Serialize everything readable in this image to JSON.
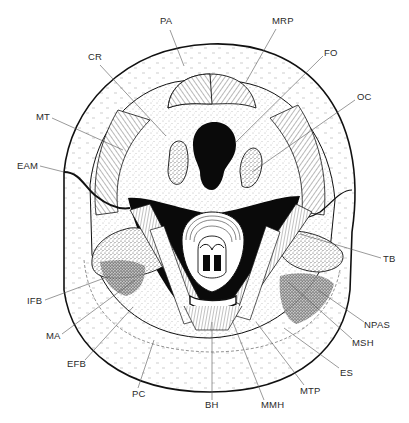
{
  "figure": {
    "type": "anatomical-diagram",
    "colors": {
      "ink": "#111111",
      "paper": "#ffffff",
      "label": "#2a2a2a",
      "leader": "#555555"
    },
    "labels": [
      {
        "id": "PA",
        "text": "PA",
        "x": 160,
        "y": 24,
        "lx1": 170,
        "ly1": 30,
        "lx2": 184,
        "ly2": 66
      },
      {
        "id": "MRP",
        "text": "MRP",
        "x": 272,
        "y": 24,
        "lx1": 276,
        "ly1": 29,
        "lx2": 246,
        "ly2": 82
      },
      {
        "id": "CR",
        "text": "CR",
        "x": 88,
        "y": 60,
        "lx1": 100,
        "ly1": 65,
        "lx2": 166,
        "ly2": 136
      },
      {
        "id": "FO",
        "text": "FO",
        "x": 324,
        "y": 56,
        "lx1": 323,
        "ly1": 56,
        "lx2": 236,
        "ly2": 142
      },
      {
        "id": "MT",
        "text": "MT",
        "x": 36,
        "y": 120,
        "lx1": 52,
        "ly1": 118,
        "lx2": 123,
        "ly2": 150
      },
      {
        "id": "OC",
        "text": "OC",
        "x": 357,
        "y": 100,
        "lx1": 355,
        "ly1": 100,
        "lx2": 252,
        "ly2": 172
      },
      {
        "id": "EAM",
        "text": "EAM",
        "x": 17,
        "y": 169,
        "lx1": 40,
        "ly1": 166,
        "lx2": 64,
        "ly2": 172
      },
      {
        "id": "TB",
        "text": "TB",
        "x": 383,
        "y": 262,
        "lx1": 381,
        "ly1": 258,
        "lx2": 300,
        "ly2": 234
      },
      {
        "id": "IFB",
        "text": "IFB",
        "x": 27,
        "y": 304,
        "lx1": 45,
        "ly1": 300,
        "lx2": 110,
        "ly2": 276
      },
      {
        "id": "NPAS",
        "text": "NPAS",
        "x": 364,
        "y": 328,
        "lx1": 364,
        "ly1": 322,
        "lx2": 318,
        "ly2": 290
      },
      {
        "id": "MSH",
        "text": "MSH",
        "x": 352,
        "y": 346,
        "lx1": 352,
        "ly1": 339,
        "lx2": 288,
        "ly2": 282
      },
      {
        "id": "MA",
        "text": "MA",
        "x": 46,
        "y": 339,
        "lx1": 62,
        "ly1": 334,
        "lx2": 135,
        "ly2": 280
      },
      {
        "id": "ES",
        "text": "ES",
        "x": 340,
        "y": 376,
        "lx1": 339,
        "ly1": 368,
        "lx2": 284,
        "ly2": 328
      },
      {
        "id": "EFB",
        "text": "EFB",
        "x": 67,
        "y": 367,
        "lx1": 85,
        "ly1": 360,
        "lx2": 133,
        "ly2": 307
      },
      {
        "id": "MTP",
        "text": "MTP",
        "x": 300,
        "y": 394,
        "lx1": 304,
        "ly1": 385,
        "lx2": 256,
        "ly2": 322
      },
      {
        "id": "PC",
        "text": "PC",
        "x": 132,
        "y": 397,
        "lx1": 138,
        "ly1": 388,
        "lx2": 154,
        "ly2": 340
      },
      {
        "id": "BH",
        "text": "BH",
        "x": 205,
        "y": 408,
        "lx1": 212,
        "ly1": 400,
        "lx2": 212,
        "ly2": 322
      },
      {
        "id": "MMH",
        "text": "MMH",
        "x": 261,
        "y": 408,
        "lx1": 264,
        "ly1": 400,
        "lx2": 232,
        "ly2": 320
      }
    ]
  }
}
